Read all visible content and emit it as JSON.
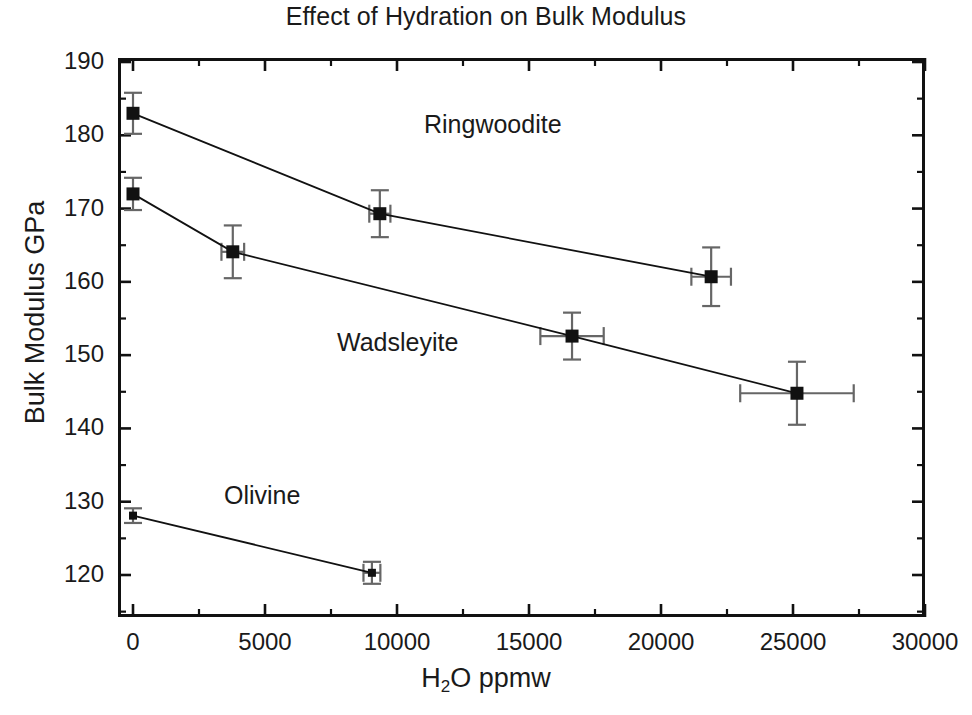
{
  "chart_data": {
    "type": "scatter",
    "title": "Effect of Hydration on Bulk Modulus",
    "xlabel": "H2O ppmw",
    "xlabel_parts": {
      "pre": "H",
      "sub": "2",
      "post": "O ppmw"
    },
    "ylabel": "Bulk Modulus GPa",
    "xlim": [
      0,
      30000
    ],
    "ylim": [
      115,
      190
    ],
    "xticks": [
      0,
      5000,
      10000,
      15000,
      20000,
      25000,
      30000
    ],
    "xtick_labels": [
      "0",
      "5000",
      "10000",
      "15000",
      "20000",
      "25000",
      "30000"
    ],
    "x_minor_interval": 2500,
    "yticks": [
      120,
      130,
      140,
      150,
      160,
      170,
      180,
      190
    ],
    "ytick_labels": [
      "120",
      "130",
      "140",
      "150",
      "160",
      "170",
      "180",
      "190"
    ],
    "y_minor_interval": 5,
    "grid": false,
    "legend": "inline-annotations",
    "marker": "filled-square",
    "marker_color": "#111111",
    "line_color": "#111111",
    "error_bar_color": "#666666",
    "series": [
      {
        "name": "Ringwoodite",
        "label_position": {
          "x": 424,
          "y": 110
        },
        "points": [
          {
            "x": 0,
            "y": 183.0,
            "xerr": 0,
            "yerr": 2.8
          },
          {
            "x": 9350,
            "y": 169.3,
            "xerr": 400,
            "yerr": 3.2
          },
          {
            "x": 21900,
            "y": 160.7,
            "xerr": 750,
            "yerr": 4.0
          }
        ]
      },
      {
        "name": "Wadsleyite",
        "label_position": {
          "x": 337,
          "y": 328
        },
        "points": [
          {
            "x": 0,
            "y": 172.0,
            "xerr": 0,
            "yerr": 2.2
          },
          {
            "x": 3780,
            "y": 164.1,
            "xerr": 430,
            "yerr": 3.6
          },
          {
            "x": 16630,
            "y": 152.6,
            "xerr": 1200,
            "yerr": 3.2
          },
          {
            "x": 25150,
            "y": 144.8,
            "xerr": 2150,
            "yerr": 4.3
          }
        ]
      },
      {
        "name": "Olivine",
        "label_position": {
          "x": 224,
          "y": 481
        },
        "points": [
          {
            "x": 0,
            "y": 128.1,
            "xerr": 0,
            "yerr": 1.0
          },
          {
            "x": 9050,
            "y": 120.3,
            "xerr": 320,
            "yerr": 1.5
          }
        ]
      }
    ]
  },
  "axes": {
    "y_title": "Bulk Modulus GPa",
    "x_title_pre": "H",
    "x_title_sub": "2",
    "x_title_post": "O ppmw"
  },
  "labels": {
    "ringwoodite": "Ringwoodite",
    "wadsleyite": "Wadsleyite",
    "olivine": "Olivine"
  }
}
